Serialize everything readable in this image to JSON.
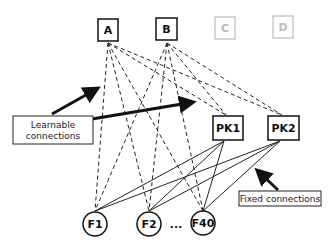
{
  "diagram": {
    "top_nodes": [
      {
        "id": "A",
        "label": "A",
        "active": true
      },
      {
        "id": "B",
        "label": "B",
        "active": true
      },
      {
        "id": "C",
        "label": "C",
        "active": false
      },
      {
        "id": "D",
        "label": "D",
        "active": false
      }
    ],
    "pk_nodes": [
      {
        "id": "PK1",
        "label": "PK1"
      },
      {
        "id": "PK2",
        "label": "PK2"
      }
    ],
    "feature_nodes": [
      {
        "id": "F1",
        "label": "F1"
      },
      {
        "id": "F2",
        "label": "F2"
      },
      {
        "id": "F40",
        "label": "F40"
      }
    ],
    "ellipsis": "...",
    "callouts": {
      "learnable": {
        "line1": "Learnable",
        "line2": "connections"
      },
      "fixed": {
        "label": "Fixed connections"
      }
    },
    "edges": {
      "learnable_style": "dashed",
      "fixed_style": "solid"
    },
    "colors": {
      "active": "#111111",
      "inactive": "#bbbbbb"
    }
  }
}
